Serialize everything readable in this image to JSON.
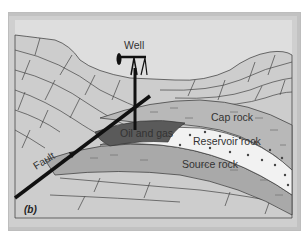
{
  "diagram": {
    "panel_label": "(b)",
    "labels": {
      "well": "Well",
      "cap_rock": "Cap rock",
      "reservoir_rock": "Reservoir rock",
      "source_rock": "Source rock",
      "oil_and_gas": "Oil and gas",
      "fault": "Fault"
    },
    "colors": {
      "sky": "#dedede",
      "bedrock": "#cdcdcd",
      "cap_rock": "#b8b8b8",
      "reservoir_rock": "#f2f2f2",
      "source_rock": "#a9a9a9",
      "oil_and_gas": "#5a5a5a",
      "lines": "#333333",
      "fault": "#111111"
    }
  }
}
